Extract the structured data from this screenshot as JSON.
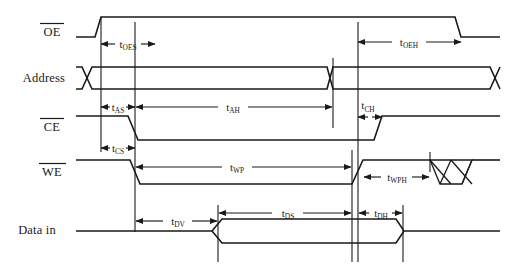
{
  "diagram": {
    "type": "timing-waveform",
    "width": 517,
    "height": 271,
    "background_color": "#ffffff",
    "line_color": "#1a1a1a",
    "signals": [
      {
        "id": "oe",
        "label": "OE",
        "overbar": true,
        "label_x": 52,
        "label_y": 36,
        "row_y_high": 17,
        "row_y_low": 37
      },
      {
        "id": "address",
        "label": "Address",
        "overbar": false,
        "label_x": 42,
        "label_y": 82,
        "row_y_high": 67,
        "row_y_low": 89
      },
      {
        "id": "ce",
        "label": "CE",
        "overbar": true,
        "label_x": 52,
        "label_y": 131,
        "row_y_high": 116,
        "row_y_low": 140
      },
      {
        "id": "we",
        "label": "WE",
        "overbar": true,
        "label_x": 52,
        "label_y": 176,
        "row_y_high": 160,
        "row_y_low": 184
      },
      {
        "id": "data_in",
        "label": "Data in",
        "overbar": false,
        "label_x": 34,
        "label_y": 230,
        "row_y_high": 219,
        "row_y_low": 243
      }
    ],
    "timing_parameters": [
      {
        "id": "t_oes",
        "base": "t",
        "sub": "OES",
        "label_x": 127,
        "label_y": 44,
        "from_x": 101,
        "to_x": 155,
        "arrow_y": 44,
        "style": "double-arrow-outward",
        "signal": "oe",
        "description": "Output enable setup time"
      },
      {
        "id": "t_oeh",
        "base": "t",
        "sub": "OEH",
        "label_x": 409,
        "label_y": 42,
        "from_x": 358,
        "to_x": 461,
        "arrow_y": 42,
        "style": "double-arrow-inward",
        "signal": "oe",
        "description": "Output enable hold time"
      },
      {
        "id": "t_as",
        "base": "t",
        "sub": "AS",
        "label_x": 117,
        "label_y": 107,
        "from_x": 101,
        "to_x": 135,
        "arrow_y": 107,
        "style": "double-arrow-outward",
        "signal": "address",
        "description": "Address setup time"
      },
      {
        "id": "t_ah",
        "base": "t",
        "sub": "AH",
        "label_x": 232,
        "label_y": 107,
        "from_x": 135,
        "to_x": 333,
        "arrow_y": 107,
        "style": "double-arrow-inward",
        "signal": "address",
        "description": "Address hold time"
      },
      {
        "id": "t_ch",
        "base": "t",
        "sub": "CH",
        "label_x": 367,
        "label_y": 105,
        "from_x": 358,
        "to_x": 382,
        "arrow_y": 117,
        "style": "double-arrow-inward",
        "signal": "ce",
        "description": "Chip enable hold time"
      },
      {
        "id": "t_cs",
        "base": "t",
        "sub": "CS",
        "label_x": 117,
        "label_y": 148,
        "from_x": 101,
        "to_x": 135,
        "arrow_y": 148,
        "style": "double-arrow-outward",
        "signal": "ce",
        "description": "Chip select setup time"
      },
      {
        "id": "t_wp",
        "base": "t",
        "sub": "WP",
        "label_x": 236,
        "label_y": 167,
        "from_x": 135,
        "to_x": 352,
        "arrow_y": 167,
        "style": "double-arrow-inward",
        "signal": "we",
        "description": "Write pulse width"
      },
      {
        "id": "t_wph",
        "base": "t",
        "sub": "WPH",
        "label_x": 396,
        "label_y": 177,
        "from_x": 363,
        "to_x": 430,
        "arrow_y": 177,
        "style": "double-arrow-inward",
        "signal": "we",
        "description": "Write pulse hold time"
      },
      {
        "id": "t_dv",
        "base": "t",
        "sub": "DV",
        "label_x": 177,
        "label_y": 221,
        "from_x": 135,
        "to_x": 218,
        "arrow_y": 221,
        "style": "double-arrow-inward",
        "signal": "data_in",
        "description": "Data valid time"
      },
      {
        "id": "t_ds",
        "base": "t",
        "sub": "DS",
        "label_x": 288,
        "label_y": 213,
        "from_x": 218,
        "to_x": 352,
        "arrow_y": 213,
        "style": "double-arrow-inward",
        "signal": "data_in",
        "description": "Data setup time"
      },
      {
        "id": "t_dh",
        "base": "t",
        "sub": "DH",
        "label_x": 379,
        "label_y": 213,
        "from_x": 358,
        "to_x": 403,
        "arrow_y": 213,
        "style": "double-arrow-outward",
        "signal": "data_in",
        "description": "Data hold time"
      }
    ],
    "reference_lines": [
      {
        "id": "ref-t1",
        "x": 101,
        "y1": 17,
        "y2": 152,
        "description": "OE rise / address valid edge"
      },
      {
        "id": "ref-t2",
        "x": 135,
        "y1": 22,
        "y2": 230,
        "description": "CE and WE falling edge"
      },
      {
        "id": "ref-t3",
        "x": 333,
        "y1": 58,
        "y2": 128,
        "description": "address change edge"
      },
      {
        "id": "ref-t4",
        "x": 352,
        "y1": 150,
        "y2": 260,
        "description": "WE rising edge"
      },
      {
        "id": "ref-t5",
        "x": 358,
        "y1": 22,
        "y2": 260,
        "description": "CE rising edge"
      },
      {
        "id": "ref-t6",
        "x": 218,
        "y1": 205,
        "y2": 260,
        "description": "data in valid start"
      },
      {
        "id": "ref-t7",
        "x": 403,
        "y1": 205,
        "y2": 260,
        "description": "data in end"
      },
      {
        "id": "ref-t8",
        "x": 430,
        "y1": 152,
        "y2": 172,
        "description": "don't care region start"
      }
    ],
    "dont_care_region": {
      "id": "we-dont-care",
      "x_start": 430,
      "x_end": 472,
      "y_top": 160,
      "y_bottom": 184,
      "pattern": "crosshatch"
    }
  }
}
